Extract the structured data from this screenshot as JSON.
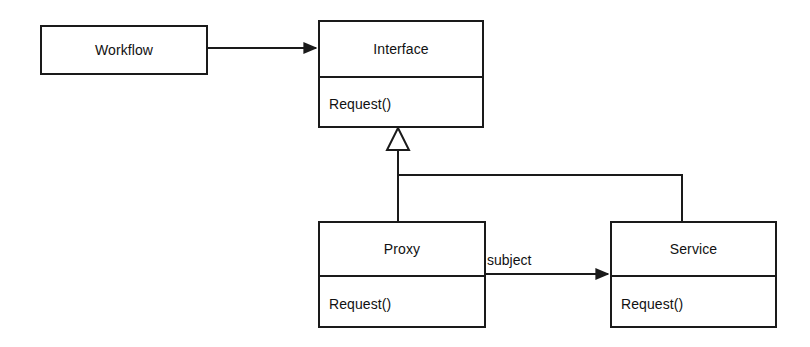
{
  "diagram": {
    "kind": "uml-class-diagram",
    "pattern": "Proxy",
    "background_color": "#ffffff",
    "line_color": "#1a1a1a",
    "text_color": "#111111"
  },
  "nodes": {
    "workflow": {
      "name": "Workflow",
      "operations": []
    },
    "interface": {
      "name": "Interface",
      "operations": [
        "Request()"
      ]
    },
    "proxy": {
      "name": "Proxy",
      "operations": [
        "Request()"
      ]
    },
    "service": {
      "name": "Service",
      "operations": [
        "Request()"
      ]
    }
  },
  "edges": {
    "workflow_to_interface": {
      "label": "",
      "type": "association",
      "arrowhead": "filled-arrow",
      "from": "Workflow",
      "to": "Interface"
    },
    "proxy_to_interface": {
      "label": "",
      "type": "generalization",
      "arrowhead": "hollow-triangle",
      "from": "Proxy",
      "to": "Interface"
    },
    "service_to_interface": {
      "label": "",
      "type": "generalization",
      "arrowhead": "hollow-triangle",
      "from": "Service",
      "to": "Interface"
    },
    "proxy_to_service": {
      "label": "subject",
      "type": "association",
      "arrowhead": "filled-arrow",
      "from": "Proxy",
      "to": "Service"
    }
  }
}
